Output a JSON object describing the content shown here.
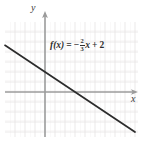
{
  "figure": {
    "axis_labels": {
      "x": "x",
      "y": "y"
    },
    "equation": {
      "full_text": "f(x) = -2/3 x + 2",
      "function_name": "f(x)",
      "equals": "=",
      "sign": "−",
      "slope_numerator": "2",
      "slope_denominator": "3",
      "slope_variable": "x",
      "plus": "+",
      "intercept": "2"
    },
    "colors": {
      "grid": "#eceaea",
      "grid_major": "#e2e0e0",
      "axis": "#9b9b9b",
      "line": "#2b2b2b",
      "text": "#2e2e2e",
      "background": "#ffffff"
    }
  },
  "chart_data": {
    "type": "line",
    "title": "",
    "xlabel": "x",
    "ylabel": "y",
    "grid": true,
    "legend": "none",
    "equation": "f(x) = -2/3 x + 2",
    "slope": -0.6667,
    "y_intercept": 2,
    "x_intercept": 3,
    "xlim": [
      -4,
      9
    ],
    "ylim": [
      -4.5,
      7
    ],
    "x": [
      -4,
      9
    ],
    "values": [
      4.667,
      -4
    ],
    "annotations": [
      {
        "text": "f(x) = -2/3 x + 2",
        "x": 0.6,
        "y": 5.4
      }
    ]
  }
}
